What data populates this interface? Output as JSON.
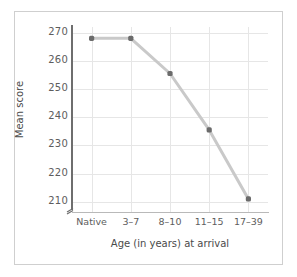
{
  "chart_data": {
    "type": "line",
    "title": "",
    "xlabel": "Age (in years) at arrival",
    "ylabel": "Mean score",
    "categories": [
      "Native",
      "3–7",
      "8–10",
      "11–15",
      "17–39"
    ],
    "values": [
      268,
      268,
      255.5,
      235.5,
      211
    ],
    "yticks": [
      270,
      260,
      250,
      240,
      230,
      220,
      210
    ],
    "ytick_labels": [
      "270",
      "260",
      "250",
      "240",
      "230",
      "220",
      "210"
    ],
    "ylim": [
      206,
      272
    ],
    "grid": true,
    "legend": null,
    "axis_break": true,
    "series": [
      {
        "name": "Mean score",
        "values": [
          268,
          268,
          255.5,
          235.5,
          211
        ]
      }
    ],
    "colors": {
      "line": "#c9c9c9",
      "marker": "#6b6b6b",
      "grid": "#e6e6e6",
      "axis": "#6e6e6e",
      "text": "#5d5d5d",
      "frame": "#cfcfcf",
      "background": "#ffffff"
    }
  }
}
